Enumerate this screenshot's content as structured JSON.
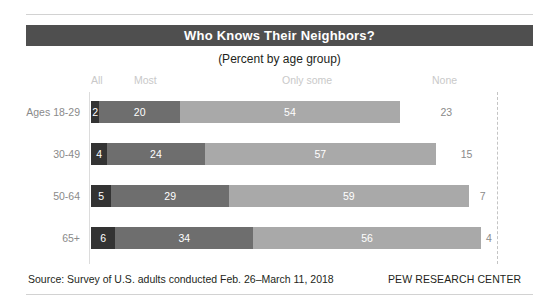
{
  "header": {
    "title": "Who Knows Their Neighbors?",
    "subtitle": "(Percent by age group)"
  },
  "footer": {
    "source": "Source: Survey of U.S. adults conducted Feb. 26–March 11, 2018",
    "brand": "PEW RESEARCH CENTER"
  },
  "legend": [
    {
      "label": "All",
      "x": 91,
      "color": "#333333"
    },
    {
      "label": "Most",
      "x": 134,
      "color": "#6e6e6e"
    },
    {
      "label": "Only some",
      "x": 282,
      "color": "#a9a9a9"
    },
    {
      "label": "None",
      "x": 432,
      "color": "#ffffff"
    }
  ],
  "colors": {
    "title_bar": "#4f4f4f",
    "all": "#333333",
    "most": "#6e6e6e",
    "only_some": "#a9a9a9",
    "none": "#ffffff",
    "label_gray": "#8a8a8a",
    "legend_gray": "#c9c9c9",
    "rule": "#d2d2d2"
  },
  "chart_data": {
    "type": "bar",
    "title": "Who Knows Their Neighbors?",
    "subtitle": "(Percent by age group)",
    "xlabel": "",
    "ylabel": "",
    "xlim": [
      0,
      100
    ],
    "grid": false,
    "stacked": true,
    "orientation": "horizontal",
    "legend_position": "top",
    "categories": [
      "Ages 18-29",
      "30-49",
      "50-64",
      "65+"
    ],
    "series": [
      {
        "name": "All",
        "values": [
          2,
          4,
          5,
          6
        ]
      },
      {
        "name": "Most",
        "values": [
          20,
          24,
          29,
          34
        ]
      },
      {
        "name": "Only some",
        "values": [
          54,
          57,
          59,
          56
        ]
      },
      {
        "name": "None",
        "values": [
          23,
          15,
          7,
          4
        ]
      }
    ],
    "rows": [
      {
        "label": "Ages 18-29",
        "segments": [
          {
            "name": "All",
            "value": 2,
            "display": "2"
          },
          {
            "name": "Most",
            "value": 20,
            "display": "20"
          },
          {
            "name": "Only some",
            "value": 54,
            "display": "54"
          },
          {
            "name": "None",
            "value": 23,
            "display": "23"
          }
        ]
      },
      {
        "label": "30-49",
        "segments": [
          {
            "name": "All",
            "value": 4,
            "display": "4"
          },
          {
            "name": "Most",
            "value": 24,
            "display": "24"
          },
          {
            "name": "Only some",
            "value": 57,
            "display": "57"
          },
          {
            "name": "None",
            "value": 15,
            "display": "15"
          }
        ]
      },
      {
        "label": "50-64",
        "segments": [
          {
            "name": "All",
            "value": 5,
            "display": "5"
          },
          {
            "name": "Most",
            "value": 29,
            "display": "29"
          },
          {
            "name": "Only some",
            "value": 59,
            "display": "59"
          },
          {
            "name": "None",
            "value": 7,
            "display": "7"
          }
        ]
      },
      {
        "label": "65+",
        "segments": [
          {
            "name": "All",
            "value": 6,
            "display": "6"
          },
          {
            "name": "Most",
            "value": 34,
            "display": "34"
          },
          {
            "name": "Only some",
            "value": 56,
            "display": "56"
          },
          {
            "name": "None",
            "value": 4,
            "display": "4"
          }
        ]
      }
    ]
  }
}
